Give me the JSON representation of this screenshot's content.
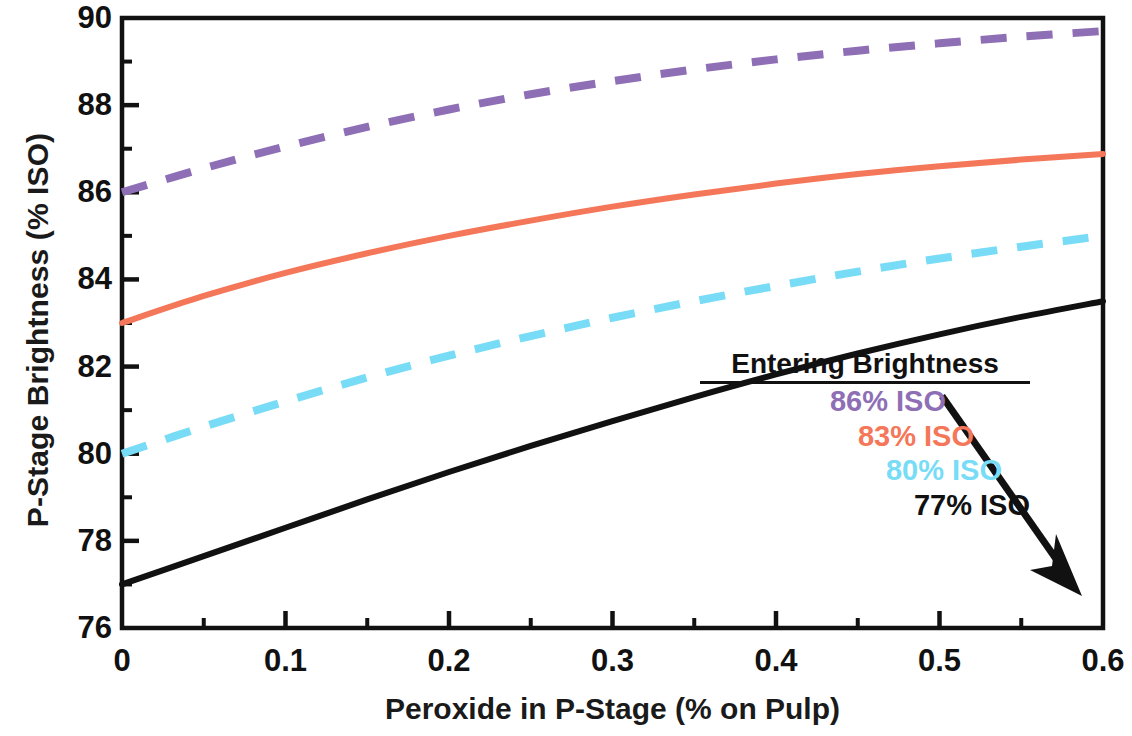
{
  "chart_data": {
    "type": "line",
    "title": "",
    "xlabel": "Peroxide in P-Stage (% on Pulp)",
    "ylabel": "P-Stage Brightness (% ISO)",
    "xlim": [
      0,
      0.6
    ],
    "ylim": [
      76,
      90
    ],
    "grid": false,
    "x_ticks": [
      "0",
      "0.1",
      "0.2",
      "0.3",
      "0.4",
      "0.5",
      "0.6"
    ],
    "x_tick_values": [
      0,
      0.1,
      0.2,
      0.3,
      0.4,
      0.5,
      0.6
    ],
    "x_minor_tick_values": [
      0.05,
      0.15,
      0.25,
      0.35,
      0.45,
      0.55
    ],
    "y_ticks": [
      "76",
      "78",
      "80",
      "82",
      "84",
      "86",
      "88",
      "90"
    ],
    "y_tick_values": [
      76,
      78,
      80,
      82,
      84,
      86,
      88,
      90
    ],
    "y_minor_tick_values": [
      77,
      79,
      81,
      83,
      85,
      87,
      89
    ],
    "legend_position": "inside-lower-right",
    "legend_title": "Entering Brightness",
    "x": [
      0,
      0.05,
      0.1,
      0.15,
      0.2,
      0.25,
      0.3,
      0.35,
      0.4,
      0.45,
      0.5,
      0.55,
      0.6
    ],
    "series": [
      {
        "name": "86% ISO",
        "label": "86% ISO",
        "color": "#8E6FB5",
        "style": "dashed",
        "entering_brightness": 86,
        "values": [
          86.0,
          86.55,
          87.05,
          87.5,
          87.9,
          88.25,
          88.55,
          88.82,
          89.05,
          89.25,
          89.42,
          89.57,
          89.7
        ]
      },
      {
        "name": "83% ISO",
        "label": "83% ISO",
        "color": "#F4775A",
        "style": "solid",
        "entering_brightness": 83,
        "values": [
          83.0,
          83.62,
          84.15,
          84.6,
          85.0,
          85.35,
          85.67,
          85.95,
          86.2,
          86.42,
          86.6,
          86.75,
          86.88
        ]
      },
      {
        "name": "80% ISO",
        "label": "80% ISO",
        "color": "#79DCF6",
        "style": "dashed",
        "entering_brightness": 80,
        "values": [
          80.0,
          80.62,
          81.2,
          81.75,
          82.25,
          82.7,
          83.12,
          83.5,
          83.85,
          84.18,
          84.48,
          84.75,
          85.0
        ]
      },
      {
        "name": "77% ISO",
        "label": "77% ISO",
        "color": "#111111",
        "style": "solid",
        "entering_brightness": 77,
        "values": [
          77.0,
          77.65,
          78.3,
          78.95,
          79.58,
          80.18,
          80.75,
          81.3,
          81.82,
          82.3,
          82.74,
          83.14,
          83.5
        ]
      }
    ],
    "annotation": {
      "type": "arrow",
      "description": "black arrow pointing down-right through the legend entries"
    }
  }
}
